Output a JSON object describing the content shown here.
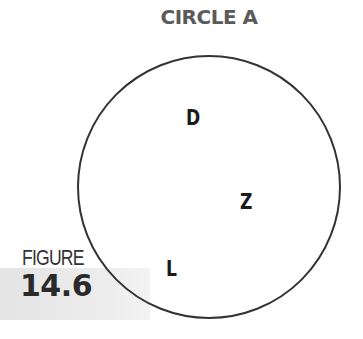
{
  "title": "CIRCLE A",
  "figure": {
    "label": "FIGURE",
    "number": "14.6"
  },
  "circle": {
    "cx": 209,
    "cy": 187,
    "r": 131,
    "stroke": "#333333"
  },
  "points": [
    {
      "label": "D",
      "x": 186,
      "y": 125
    },
    {
      "label": "Z",
      "x": 240,
      "y": 209
    },
    {
      "label": "L",
      "x": 166,
      "y": 276
    }
  ]
}
